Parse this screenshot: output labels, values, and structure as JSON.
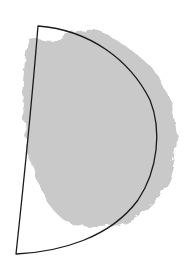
{
  "figure": {
    "background": "#ffffff",
    "blob": {
      "fill": "#c9c9c9",
      "description": "irregular grey region"
    },
    "outline": {
      "stroke": "#1a1a1a",
      "stroke_width": 1.3,
      "description": "D-shaped closed curve outline"
    }
  }
}
